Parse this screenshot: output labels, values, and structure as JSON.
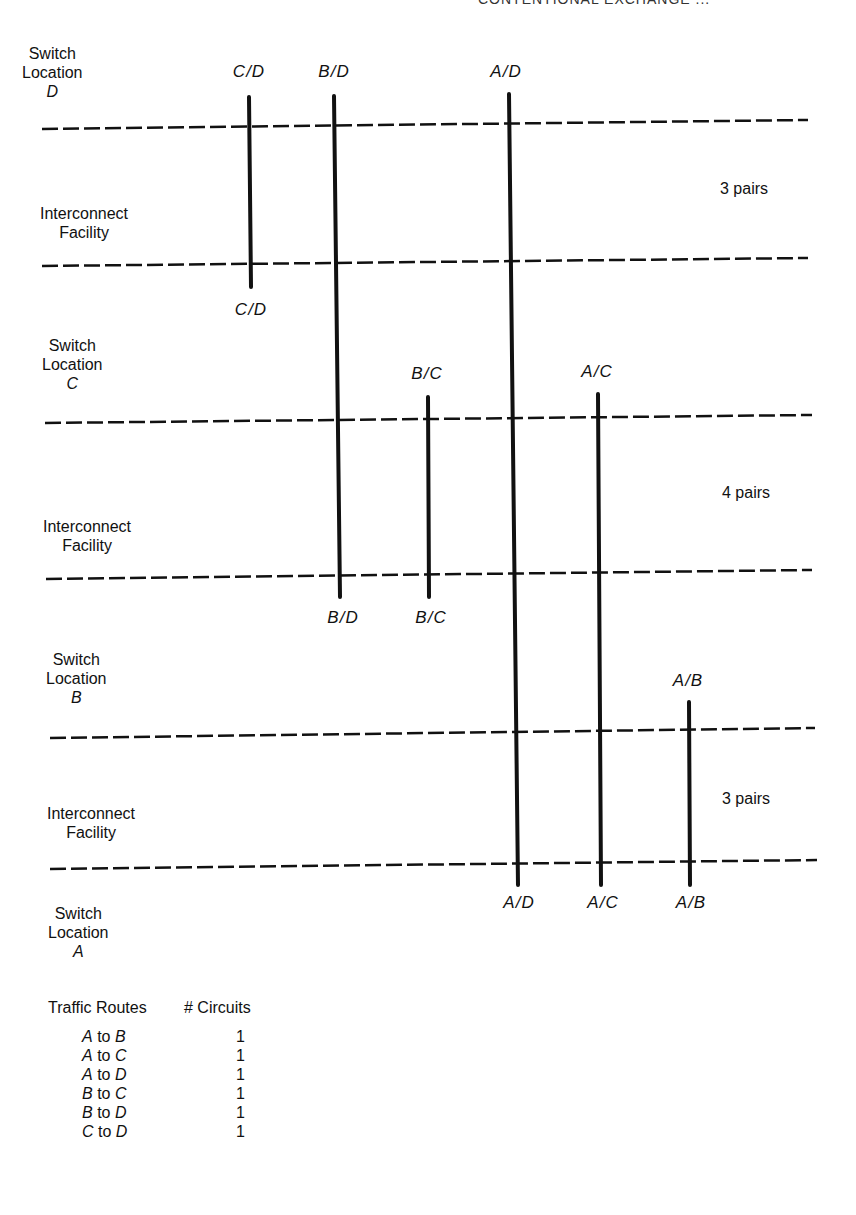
{
  "header": {
    "text": "CONTENTIONAL EXCHANGE ..."
  },
  "diagram": {
    "rows": [
      {
        "type": "switch",
        "label_line1": "Switch",
        "label_line2": "Location",
        "letter": "D"
      },
      {
        "type": "interconnect",
        "label_line1": "Interconnect",
        "label_line2": "Facility",
        "pairs": "3 pairs"
      },
      {
        "type": "switch",
        "label_line1": "Switch",
        "label_line2": "Location",
        "letter": "C"
      },
      {
        "type": "interconnect",
        "label_line1": "Interconnect",
        "label_line2": "Facility",
        "pairs": "4 pairs"
      },
      {
        "type": "switch",
        "label_line1": "Switch",
        "label_line2": "Location",
        "letter": "B"
      },
      {
        "type": "interconnect",
        "label_line1": "Interconnect",
        "label_line2": "Facility",
        "pairs": "3 pairs"
      },
      {
        "type": "switch",
        "label_line1": "Switch",
        "label_line2": "Location",
        "letter": "A"
      }
    ],
    "circuit_labels": {
      "cd_top": "C/D",
      "bd_top": "B/D",
      "ad_top": "A/D",
      "cd_bottom": "C/D",
      "bc_top": "B/C",
      "ac_top": "A/C",
      "bd_bottom": "B/D",
      "bc_bottom": "B/C",
      "ab_top": "A/B",
      "ad_bottom": "A/D",
      "ac_bottom": "A/C",
      "ab_bottom": "A/B"
    }
  },
  "legend": {
    "col1": "Traffic Routes",
    "col2": "# Circuits",
    "rows": [
      {
        "from": "A",
        "to_word": "to",
        "to": "B",
        "count": "1"
      },
      {
        "from": "A",
        "to_word": "to",
        "to": "C",
        "count": "1"
      },
      {
        "from": "A",
        "to_word": "to",
        "to": "D",
        "count": "1"
      },
      {
        "from": "B",
        "to_word": "to",
        "to": "C",
        "count": "1"
      },
      {
        "from": "B",
        "to_word": "to",
        "to": "D",
        "count": "1"
      },
      {
        "from": "C",
        "to_word": "to",
        "to": "D",
        "count": "1"
      }
    ]
  }
}
